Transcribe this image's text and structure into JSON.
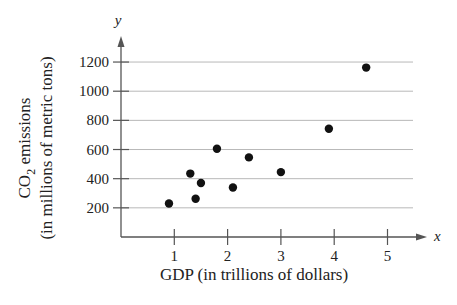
{
  "chart_data": {
    "type": "scatter",
    "title": "",
    "xlabel": "GDP (in trillions of dollars)",
    "ylabel_line1": "CO2 emissions",
    "ylabel_line2": "(in millions of metric tons)",
    "x_var": "x",
    "y_var": "y",
    "xlim": [
      0,
      5.5
    ],
    "ylim": [
      0,
      1300
    ],
    "x_ticks": [
      1,
      2,
      3,
      4,
      5
    ],
    "y_ticks": [
      200,
      400,
      600,
      800,
      1000,
      1200
    ],
    "grid": "horizontal",
    "legend": null,
    "points": [
      {
        "x": 0.9,
        "y": 230
      },
      {
        "x": 1.3,
        "y": 435
      },
      {
        "x": 1.4,
        "y": 262
      },
      {
        "x": 1.5,
        "y": 370
      },
      {
        "x": 1.8,
        "y": 605
      },
      {
        "x": 2.1,
        "y": 340
      },
      {
        "x": 2.4,
        "y": 546
      },
      {
        "x": 3.0,
        "y": 445
      },
      {
        "x": 3.9,
        "y": 742
      },
      {
        "x": 4.6,
        "y": 1162
      }
    ]
  },
  "colors": {
    "axis": "#555555",
    "grid": "#b8b8b8",
    "point": "#111111",
    "text": "#222222"
  }
}
